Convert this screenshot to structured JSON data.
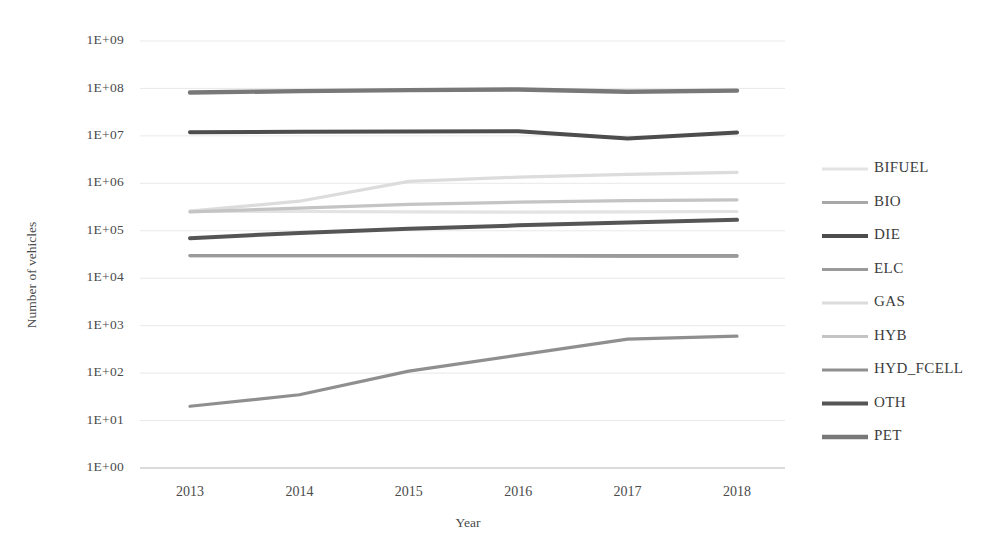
{
  "chart_data": {
    "type": "line",
    "title": "",
    "xlabel": "Year",
    "ylabel": "Number of vehicles",
    "categories": [
      "2013",
      "2014",
      "2015",
      "2016",
      "2017",
      "2018"
    ],
    "x": [
      2013,
      2014,
      2015,
      2016,
      2017,
      2018
    ],
    "yscale": "log",
    "ylim": [
      1,
      1000000000
    ],
    "ytick_labels": [
      "1E+09",
      "1E+08",
      "1E+07",
      "1E+06",
      "1E+05",
      "1E+04",
      "1E+03",
      "1E+02",
      "1E+01",
      "1E+00"
    ],
    "ytick_values": [
      1000000000,
      100000000,
      10000000,
      1000000,
      100000,
      10000,
      1000,
      100,
      10,
      1
    ],
    "grid": true,
    "legend_position": "right",
    "series": [
      {
        "name": "BIFUEL",
        "color": "#e3e3e3",
        "width": 3.2,
        "values": [
          260000,
          255000,
          250000,
          248000,
          250000,
          255000
        ]
      },
      {
        "name": "BIO",
        "color": "#a8a8a8",
        "width": 3.2,
        "values": [
          30000,
          30000,
          30000,
          29500,
          29000,
          29000
        ]
      },
      {
        "name": "DIE",
        "color": "#4d4d4d",
        "width": 4.0,
        "values": [
          12000000,
          12200000,
          12400000,
          12500000,
          8800000,
          11800000
        ]
      },
      {
        "name": "ELC",
        "color": "#9a9a9a",
        "width": 3.2,
        "values": [
          30000,
          30000,
          30000,
          30000,
          30000,
          30000
        ]
      },
      {
        "name": "GAS",
        "color": "#dcdcdc",
        "width": 3.2,
        "values": [
          260000,
          420000,
          1100000,
          1350000,
          1550000,
          1700000
        ]
      },
      {
        "name": "HYB",
        "color": "#c4c4c4",
        "width": 3.2,
        "values": [
          250000,
          300000,
          360000,
          400000,
          430000,
          450000
        ]
      },
      {
        "name": "HYD_FCELL",
        "color": "#8f8f8f",
        "width": 3.2,
        "values": [
          20,
          35,
          110,
          240,
          520,
          600
        ]
      },
      {
        "name": "OTH",
        "color": "#555555",
        "width": 4.0,
        "values": [
          70000,
          90000,
          110000,
          130000,
          150000,
          170000
        ]
      },
      {
        "name": "PET",
        "color": "#787878",
        "width": 4.4,
        "values": [
          82000000,
          88000000,
          92000000,
          95000000,
          85000000,
          90000000
        ]
      }
    ]
  },
  "legend": {
    "items": [
      {
        "label": "BIFUEL"
      },
      {
        "label": "BIO"
      },
      {
        "label": "DIE"
      },
      {
        "label": "ELC"
      },
      {
        "label": "GAS"
      },
      {
        "label": "HYB"
      },
      {
        "label": "HYD_FCELL"
      },
      {
        "label": "OTH"
      },
      {
        "label": "PET"
      }
    ]
  }
}
